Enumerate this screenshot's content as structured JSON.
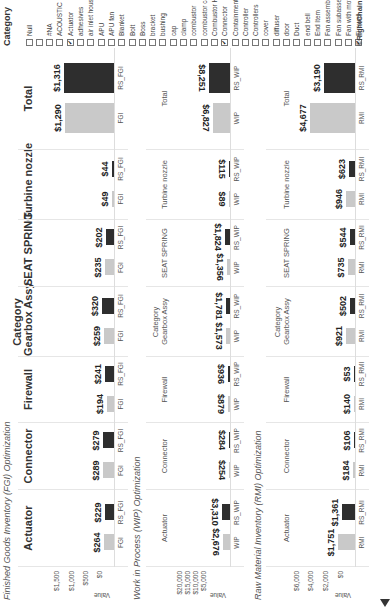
{
  "categories": [
    "Actuator",
    "Connector",
    "Firewall",
    "Gearbox Assy",
    "SEAT SPRING",
    "Turbine nozzle",
    "Total"
  ],
  "category_header": "Category",
  "value_axis_title": "Value",
  "sections": {
    "fgi": {
      "title": "Finished Goods Inventory (FGI) Optimization",
      "base_label": "FGI",
      "rs_label": "RS_FGI",
      "ticks": [
        "$1,500",
        "$1,000",
        "$500",
        "$0"
      ],
      "base": [
        "$264",
        "$289",
        "$194",
        "$259",
        "$235",
        "$49",
        "$1,290"
      ],
      "rs": [
        "$229",
        "$279",
        "$241",
        "$320",
        "$202",
        "$44",
        "$1,316"
      ]
    },
    "wip": {
      "title": "Work in Process (WIP) Optimization",
      "base_label": "WIP",
      "rs_label": "RS_WIP",
      "ticks": [
        "$20,000",
        "$15,000",
        "$10,000",
        "$5,000"
      ],
      "base": [
        "$2,676",
        "$254",
        "$879",
        "$1,573",
        "$1,356",
        "$89",
        "$6,827"
      ],
      "rs": [
        "$3,310",
        "$284",
        "$936",
        "$1,781",
        "$1,824",
        "$115",
        "$8,251"
      ]
    },
    "rmi": {
      "title": "Raw Material Inventory (RMI) Optimization",
      "base_label": "RMI",
      "rs_label": "RS_RMI",
      "ticks": [
        "$6,000",
        "$4,000",
        "$2,000",
        "$0"
      ],
      "base": [
        "$1,751",
        "$184",
        "$140",
        "$921",
        "$735",
        "$946",
        "$4,677"
      ],
      "rs": [
        "$1,361",
        "$106",
        "$53",
        "$502",
        "$544",
        "$623",
        "$3,190"
      ]
    }
  },
  "legend": {
    "title": "Category",
    "items": [
      {
        "label": "Null",
        "checked": false
      },
      {
        "label": "",
        "checked": false
      },
      {
        "label": "#NA",
        "checked": false
      },
      {
        "label": "ACOUSTIC PLATE",
        "checked": false
      },
      {
        "label": "Actuator",
        "checked": true
      },
      {
        "label": "adhesives",
        "checked": false
      },
      {
        "label": "air inlet housing",
        "checked": false
      },
      {
        "label": "APU",
        "checked": false
      },
      {
        "label": "APU fan",
        "checked": false
      },
      {
        "label": "Blanket",
        "checked": false
      },
      {
        "label": "Bolt",
        "checked": false
      },
      {
        "label": "Boss",
        "checked": false
      },
      {
        "label": "bracket",
        "checked": false
      },
      {
        "label": "bushing",
        "checked": false
      },
      {
        "label": "cap",
        "checked": false
      },
      {
        "label": "clamp",
        "checked": false
      },
      {
        "label": "combustor",
        "checked": false
      },
      {
        "label": "combustor case",
        "checked": false
      },
      {
        "label": "Combustor Housing",
        "checked": false
      },
      {
        "label": "Connector",
        "checked": true
      },
      {
        "label": "Containment",
        "checked": false
      },
      {
        "label": "Controller",
        "checked": false
      },
      {
        "label": "Controllers",
        "checked": false
      },
      {
        "label": "cover",
        "checked": false
      },
      {
        "label": "diffuser",
        "checked": false
      },
      {
        "label": "door",
        "checked": false
      },
      {
        "label": "Duct",
        "checked": false
      },
      {
        "label": "end bell",
        "checked": false
      },
      {
        "label": "End Item",
        "checked": false
      },
      {
        "label": "Fan assembly with...",
        "checked": false
      },
      {
        "label": "Fan subassembly...",
        "checked": false
      },
      {
        "label": "Fan with motor drive",
        "checked": false
      },
      {
        "label": "Firewall",
        "checked": true
      }
    ]
  },
  "brand": "©RightChain™",
  "colors": {
    "base": "#c9c9c9",
    "rs": "#2e2e2e"
  },
  "chart_data": [
    {
      "type": "bar",
      "title": "Finished Goods Inventory (FGI) Optimization",
      "xlabel": "Category",
      "ylabel": "Value",
      "ylim": [
        0,
        1500
      ],
      "categories": [
        "Actuator",
        "Connector",
        "Firewall",
        "Gearbox Assy",
        "SEAT SPRING",
        "Turbine nozzle",
        "Total"
      ],
      "series": [
        {
          "name": "FGI",
          "values": [
            264,
            289,
            194,
            259,
            235,
            49,
            1290
          ]
        },
        {
          "name": "RS_FGI",
          "values": [
            229,
            279,
            241,
            320,
            202,
            44,
            1316
          ]
        }
      ]
    },
    {
      "type": "bar",
      "title": "Work in Process (WIP) Optimization",
      "xlabel": "Category",
      "ylabel": "Value",
      "ylim": [
        0,
        20000
      ],
      "categories": [
        "Actuator",
        "Connector",
        "Firewall",
        "Gearbox Assy",
        "SEAT SPRING",
        "Turbine nozzle",
        "Total"
      ],
      "series": [
        {
          "name": "WIP",
          "values": [
            2676,
            254,
            879,
            1573,
            1356,
            89,
            6827
          ]
        },
        {
          "name": "RS_WIP",
          "values": [
            3310,
            284,
            936,
            1781,
            1824,
            115,
            8251
          ]
        }
      ]
    },
    {
      "type": "bar",
      "title": "Raw Material Inventory (RMI) Optimization",
      "xlabel": "Category",
      "ylabel": "Value",
      "ylim": [
        0,
        6000
      ],
      "categories": [
        "Actuator",
        "Connector",
        "Firewall",
        "Gearbox Assy",
        "SEAT SPRING",
        "Turbine nozzle",
        "Total"
      ],
      "series": [
        {
          "name": "RMI",
          "values": [
            1751,
            184,
            140,
            921,
            735,
            946,
            4677
          ]
        },
        {
          "name": "RS_RMI",
          "values": [
            1361,
            106,
            53,
            502,
            544,
            623,
            3190
          ]
        }
      ]
    }
  ]
}
